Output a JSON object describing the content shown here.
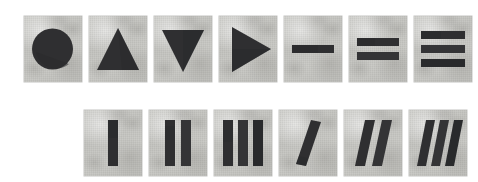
{
  "figure": {
    "background_color": "#ffffff",
    "card_color": "#c8c8c4",
    "ink_color": "#2f2f31",
    "card_width": 58,
    "card_height": 66,
    "card_gap": 7,
    "rows": [
      {
        "name": "top-row",
        "x": 24,
        "y": 16,
        "count": 7,
        "cards": [
          {
            "id": "card-circle",
            "shape": "circle",
            "label": "filled circle",
            "count": 1,
            "orientation": "none"
          },
          {
            "id": "card-triangle-up",
            "shape": "triangle-up",
            "label": "triangle pointing up",
            "count": 1,
            "orientation": "up"
          },
          {
            "id": "card-triangle-down",
            "shape": "triangle-down",
            "label": "triangle pointing down",
            "count": 1,
            "orientation": "down"
          },
          {
            "id": "card-triangle-right",
            "shape": "triangle-right",
            "label": "triangle pointing right",
            "count": 1,
            "orientation": "right"
          },
          {
            "id": "card-bar-h-1",
            "shape": "horizontal-bars",
            "label": "one horizontal bar",
            "count": 1,
            "orientation": "horizontal"
          },
          {
            "id": "card-bar-h-2",
            "shape": "horizontal-bars",
            "label": "two horizontal bars",
            "count": 2,
            "orientation": "horizontal"
          },
          {
            "id": "card-bar-h-3",
            "shape": "horizontal-bars",
            "label": "three horizontal bars",
            "count": 3,
            "orientation": "horizontal"
          }
        ]
      },
      {
        "name": "bottom-row",
        "x": 84,
        "y": 110,
        "count": 6,
        "cards": [
          {
            "id": "card-bar-v-1",
            "shape": "vertical-bars",
            "label": "one vertical bar",
            "count": 1,
            "orientation": "vertical"
          },
          {
            "id": "card-bar-v-2",
            "shape": "vertical-bars",
            "label": "two vertical bars",
            "count": 2,
            "orientation": "vertical"
          },
          {
            "id": "card-bar-v-3",
            "shape": "vertical-bars",
            "label": "three vertical bars",
            "count": 3,
            "orientation": "vertical"
          },
          {
            "id": "card-bar-d-1",
            "shape": "diagonal-bars",
            "label": "one diagonal bar",
            "count": 1,
            "orientation": "diagonal"
          },
          {
            "id": "card-bar-d-2",
            "shape": "diagonal-bars",
            "label": "two diagonal bars",
            "count": 2,
            "orientation": "diagonal"
          },
          {
            "id": "card-bar-d-3",
            "shape": "diagonal-bars",
            "label": "three diagonal bars",
            "count": 3,
            "orientation": "diagonal"
          }
        ]
      }
    ]
  }
}
